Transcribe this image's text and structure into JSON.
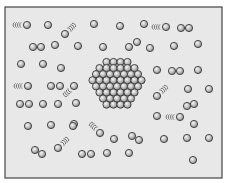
{
  "diagram": {
    "colors": {
      "page_background": "#ffffff",
      "frame_background": "#e8e8e8",
      "frame_border": "#444444",
      "particle_fill": "#b9b9b9",
      "particle_highlight": "#f5f5f5",
      "particle_outline": "#3a3a3a",
      "motion_lines": "#555555"
    },
    "frame": {
      "x": 5,
      "y": 7,
      "width": 217,
      "height": 171
    },
    "particle_radius": 3.6,
    "free_particles": [
      [
        27,
        25
      ],
      [
        48,
        25
      ],
      [
        94,
        24
      ],
      [
        120,
        26
      ],
      [
        144,
        24
      ],
      [
        166,
        27
      ],
      [
        181,
        28
      ],
      [
        189,
        28
      ],
      [
        33,
        47
      ],
      [
        41,
        47
      ],
      [
        55,
        45
      ],
      [
        65,
        34
      ],
      [
        78,
        46
      ],
      [
        103,
        47
      ],
      [
        129,
        47
      ],
      [
        137,
        42
      ],
      [
        150,
        48
      ],
      [
        174,
        46
      ],
      [
        198,
        44
      ],
      [
        21,
        64
      ],
      [
        43,
        64
      ],
      [
        61,
        68
      ],
      [
        157,
        70
      ],
      [
        172,
        71
      ],
      [
        180,
        71
      ],
      [
        198,
        70
      ],
      [
        28,
        86
      ],
      [
        51,
        86
      ],
      [
        60,
        86
      ],
      [
        74,
        86
      ],
      [
        188,
        89
      ],
      [
        209,
        89
      ],
      [
        157,
        96
      ],
      [
        20,
        104
      ],
      [
        29,
        104
      ],
      [
        43,
        104
      ],
      [
        58,
        104
      ],
      [
        76,
        103
      ],
      [
        187,
        106
      ],
      [
        194,
        104
      ],
      [
        157,
        116
      ],
      [
        180,
        117
      ],
      [
        194,
        124
      ],
      [
        28,
        126
      ],
      [
        51,
        125
      ],
      [
        74,
        124
      ],
      [
        73,
        126
      ],
      [
        100,
        133
      ],
      [
        132,
        136
      ],
      [
        139,
        140
      ],
      [
        164,
        139
      ],
      [
        187,
        138
      ],
      [
        209,
        138
      ],
      [
        114,
        139
      ],
      [
        58,
        148
      ],
      [
        35,
        150
      ],
      [
        42,
        154
      ],
      [
        82,
        154
      ],
      [
        91,
        154
      ],
      [
        107,
        153
      ],
      [
        129,
        153
      ],
      [
        193,
        160
      ]
    ],
    "motion_trails": [
      {
        "x": 27,
        "y": 25,
        "dir": "left"
      },
      {
        "x": 65,
        "y": 34,
        "dir": "up-right"
      },
      {
        "x": 166,
        "y": 27,
        "dir": "left"
      },
      {
        "x": 28,
        "y": 86,
        "dir": "left"
      },
      {
        "x": 74,
        "y": 86,
        "dir": "down-left"
      },
      {
        "x": 58,
        "y": 148,
        "dir": "up-right"
      },
      {
        "x": 100,
        "y": 133,
        "dir": "up-left"
      },
      {
        "x": 180,
        "y": 117,
        "dir": "left"
      },
      {
        "x": 157,
        "y": 96,
        "dir": "up-right"
      }
    ],
    "cluster": {
      "center_x": 117,
      "top_y": 62,
      "spacing": 7,
      "row_counts": [
        4,
        6,
        7,
        8,
        7,
        6,
        5,
        4
      ]
    }
  }
}
